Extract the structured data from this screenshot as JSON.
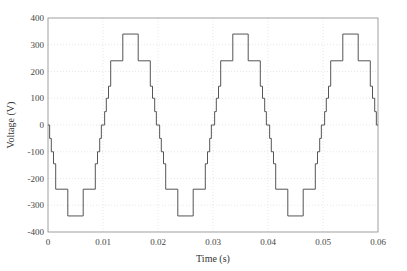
{
  "chart_data": {
    "type": "line",
    "title": "",
    "xlabel": "Time (s)",
    "ylabel": "Voltage (V)",
    "xlim": [
      0,
      0.06
    ],
    "ylim": [
      -400,
      400
    ],
    "xticks": [
      0,
      0.01,
      0.02,
      0.03,
      0.04,
      0.05,
      0.06
    ],
    "xtick_labels": [
      "0",
      "0.01",
      "0.02",
      "0.03",
      "0.04",
      "0.05",
      "0.06"
    ],
    "yticks": [
      -400,
      -300,
      -200,
      -100,
      0,
      100,
      200,
      300,
      400
    ],
    "ytick_labels": [
      "-400",
      "-300",
      "-200",
      "-100",
      "0",
      "100",
      "200",
      "300",
      "400"
    ],
    "grid": true,
    "legend": null,
    "series": [
      {
        "name": "Staircase output voltage",
        "color": "#555555",
        "frequency_hz": 50,
        "levels": [
          -340,
          -240,
          -145,
          -100,
          -50,
          0,
          50,
          100,
          145,
          240,
          340
        ],
        "period_steps": [
          {
            "t": 0.0,
            "v": 0
          },
          {
            "t": 0.0003,
            "v": -50
          },
          {
            "t": 0.0006,
            "v": -100
          },
          {
            "t": 0.001,
            "v": -145
          },
          {
            "t": 0.0014,
            "v": -240
          },
          {
            "t": 0.0036,
            "v": -340
          },
          {
            "t": 0.0064,
            "v": -240
          },
          {
            "t": 0.0086,
            "v": -145
          },
          {
            "t": 0.009,
            "v": -100
          },
          {
            "t": 0.0094,
            "v": -50
          },
          {
            "t": 0.0097,
            "v": 0
          },
          {
            "t": 0.01,
            "v": 0
          },
          {
            "t": 0.0103,
            "v": 50
          },
          {
            "t": 0.0106,
            "v": 100
          },
          {
            "t": 0.011,
            "v": 145
          },
          {
            "t": 0.0114,
            "v": 240
          },
          {
            "t": 0.0136,
            "v": 340
          },
          {
            "t": 0.0164,
            "v": 240
          },
          {
            "t": 0.0186,
            "v": 145
          },
          {
            "t": 0.019,
            "v": 100
          },
          {
            "t": 0.0194,
            "v": 50
          },
          {
            "t": 0.0197,
            "v": 0
          }
        ],
        "periods": 3
      }
    ]
  }
}
